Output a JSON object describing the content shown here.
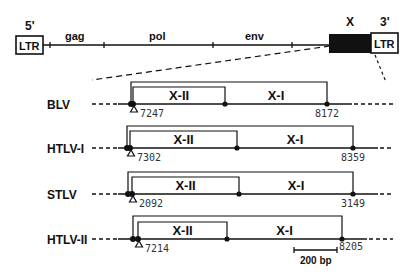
{
  "genome": {
    "ltr5": {
      "prime": "5'",
      "label": "LTR"
    },
    "ltr3": {
      "prime": "3'",
      "label": "LTR"
    },
    "genes": [
      {
        "label": "gag",
        "x": 75
      },
      {
        "label": "pol",
        "x": 158
      },
      {
        "label": "env",
        "x": 255
      }
    ],
    "x_region": {
      "label": "X"
    },
    "ticks": [
      50,
      104,
      213,
      292
    ]
  },
  "rows": [
    {
      "virus": "BLV",
      "y": 104,
      "start": 131,
      "x2_start": 133,
      "x2_end": 225,
      "x2_top": 87,
      "x1_end": 327,
      "outer_top": 82,
      "pos_start": "7247",
      "pos_end": "8172",
      "orf2_label": "X-II",
      "orf1_label": "X-I"
    },
    {
      "virus": "HTLV-I",
      "y": 148,
      "start": 127,
      "x2_start": 130,
      "x2_end": 237,
      "x2_top": 131,
      "x1_end": 353,
      "outer_top": 126,
      "pos_start": "7302",
      "pos_end": "8359",
      "orf2_label": "X-II",
      "orf1_label": "X-I"
    },
    {
      "virus": "STLV",
      "y": 194,
      "start": 128,
      "x2_start": 132,
      "x2_end": 239,
      "x2_top": 177,
      "x1_end": 353,
      "outer_top": 172,
      "pos_start": "2092",
      "pos_end": "3149",
      "orf2_label": "X-II",
      "orf1_label": "X-I"
    },
    {
      "virus": "HTLV-II",
      "y": 239,
      "start": 133,
      "x2_start": 138,
      "x2_end": 227,
      "x2_top": 222,
      "x1_end": 342,
      "outer_top": 216,
      "pos_start": "7214",
      "pos_end": "8205",
      "orf2_label": "X-II",
      "orf1_label": "X-I"
    }
  ],
  "scale_bar": {
    "label": "200 bp"
  },
  "colors": {
    "ink": "#111111",
    "numbers": "#333333",
    "background": "#ffffff"
  }
}
